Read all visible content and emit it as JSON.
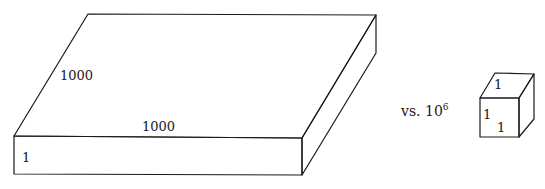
{
  "figure": {
    "slab": {
      "depth_label": "1000",
      "width_label": "1000",
      "height_label": "1"
    },
    "comparison": {
      "prefix": "vs. 10",
      "exponent": "6"
    },
    "cube": {
      "top_label": "1",
      "side_label": "1",
      "front_label": "1"
    },
    "colors": {
      "line": "#1a1a1a",
      "background": "#ffffff"
    }
  }
}
